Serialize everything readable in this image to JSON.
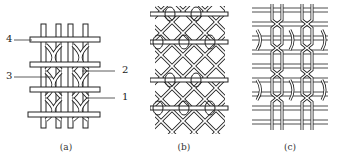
{
  "figure": {
    "panels": [
      {
        "id": "a",
        "caption": "(a)",
        "labels": [
          "4",
          "3",
          "2",
          "1"
        ]
      },
      {
        "id": "b",
        "caption": "(b)"
      },
      {
        "id": "c",
        "caption": "(c)"
      }
    ],
    "colors": {
      "stroke": "#222222",
      "fill": "#ffffff"
    }
  }
}
